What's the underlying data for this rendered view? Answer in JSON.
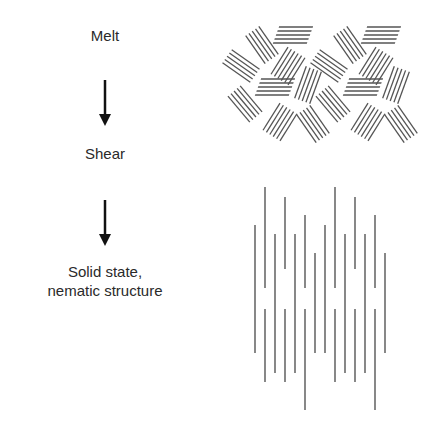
{
  "labels": {
    "melt": "Melt",
    "shear": "Shear",
    "solid_line1": "Solid state,",
    "solid_line2": "nematic structure"
  },
  "arrows": [
    {
      "name": "arrow-melt-to-shear",
      "x": 105,
      "y1": 80,
      "y2": 125
    },
    {
      "name": "arrow-shear-to-solid",
      "x": 105,
      "y1": 200,
      "y2": 245
    }
  ],
  "colors": {
    "line": "#555555",
    "arrow": "#111111",
    "text": "#2a2a2a"
  },
  "nematic_lines": [
    {
      "x": 255,
      "y1": 225,
      "y2": 353
    },
    {
      "x": 265,
      "y1": 187,
      "y2": 288
    },
    {
      "x": 265,
      "y1": 309,
      "y2": 382
    },
    {
      "x": 275,
      "y1": 234,
      "y2": 373
    },
    {
      "x": 285,
      "y1": 197,
      "y2": 269
    },
    {
      "x": 285,
      "y1": 309,
      "y2": 382
    },
    {
      "x": 295,
      "y1": 234,
      "y2": 373
    },
    {
      "x": 305,
      "y1": 215,
      "y2": 288
    },
    {
      "x": 305,
      "y1": 309,
      "y2": 410
    },
    {
      "x": 315,
      "y1": 253,
      "y2": 353
    },
    {
      "x": 325,
      "y1": 225,
      "y2": 353
    },
    {
      "x": 335,
      "y1": 187,
      "y2": 288
    },
    {
      "x": 335,
      "y1": 309,
      "y2": 382
    },
    {
      "x": 345,
      "y1": 234,
      "y2": 373
    },
    {
      "x": 355,
      "y1": 197,
      "y2": 269
    },
    {
      "x": 355,
      "y1": 309,
      "y2": 382
    },
    {
      "x": 365,
      "y1": 234,
      "y2": 373
    },
    {
      "x": 375,
      "y1": 215,
      "y2": 288
    },
    {
      "x": 375,
      "y1": 309,
      "y2": 410
    },
    {
      "x": 385,
      "y1": 253,
      "y2": 353
    }
  ]
}
